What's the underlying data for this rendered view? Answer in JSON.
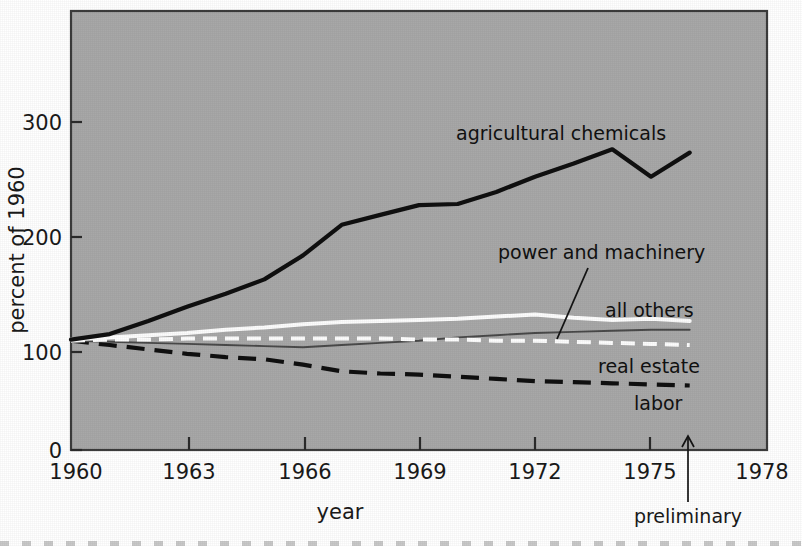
{
  "chart_data": {
    "type": "line",
    "title": "",
    "subtitle": "",
    "xlabel": "year",
    "ylabel": "percent of 1960",
    "xlim": [
      1960,
      1978
    ],
    "ylim": [
      0,
      330
    ],
    "grid": false,
    "legend_position": "inline-labels",
    "background_color": "#a8a8a8",
    "x_ticks": [
      "1960",
      "1963",
      "1966",
      "1969",
      "1972",
      "1975",
      "1978"
    ],
    "x_tick_values": [
      1960,
      1963,
      1966,
      1969,
      1972,
      1975,
      1978
    ],
    "y_ticks": [
      "0",
      "100",
      "200",
      "300"
    ],
    "y_tick_values": [
      0,
      100,
      200,
      300
    ],
    "x": [
      1960,
      1961,
      1962,
      1963,
      1964,
      1965,
      1966,
      1967,
      1968,
      1969,
      1970,
      1971,
      1972,
      1973,
      1974,
      1975,
      1976
    ],
    "annotations": [
      {
        "text": "preliminary",
        "points_to_year": 1976
      }
    ],
    "series": [
      {
        "name": "agricultural chemicals",
        "label": "agricultural chemicals",
        "style": "solid",
        "color": "#101010",
        "width": "thick",
        "values": [
          101,
          106,
          118,
          131,
          143,
          156,
          178,
          206,
          215,
          224,
          225,
          236,
          250,
          262,
          275,
          250,
          272
        ]
      },
      {
        "name": "power and machinery",
        "label": "power and machinery",
        "style": "solid",
        "color": "#fdfdfd",
        "width": "thick",
        "values": [
          101,
          103,
          105,
          107,
          110,
          112,
          115,
          117,
          118,
          119,
          120,
          122,
          124,
          121,
          119,
          120,
          118
        ]
      },
      {
        "name": "all others",
        "label": "all others",
        "style": "solid",
        "color": "#4a4a4a",
        "width": "thin",
        "values": [
          100,
          99,
          98,
          97,
          96,
          95,
          94,
          96,
          98,
          100,
          103,
          105,
          107,
          108,
          109,
          110,
          110
        ]
      },
      {
        "name": "real estate",
        "label": "real estate",
        "style": "dashed",
        "color": "#fdfdfd",
        "width": "thick",
        "values": [
          100,
          101,
          101,
          102,
          102,
          102,
          102,
          102,
          102,
          101,
          101,
          100,
          100,
          99,
          98,
          97,
          96
        ]
      },
      {
        "name": "labor",
        "label": "labor",
        "style": "dashed",
        "color": "#101010",
        "width": "thick",
        "values": [
          100,
          96,
          92,
          88,
          85,
          83,
          78,
          72,
          70,
          69,
          67,
          65,
          63,
          62,
          61,
          60,
          59
        ]
      }
    ]
  },
  "axes": {
    "y_title": "percent of 1960",
    "x_title": "year"
  },
  "labels": {
    "agricultural_chemicals": "agricultural chemicals",
    "power_and_machinery": "power and machinery",
    "all_others": "all others",
    "real_estate": "real estate",
    "labor": "labor",
    "preliminary": "preliminary"
  },
  "x_tick_labels": {
    "t0": "1960",
    "t1": "1963",
    "t2": "1966",
    "t3": "1969",
    "t4": "1972",
    "t5": "1975",
    "t6": "1978"
  },
  "y_tick_labels": {
    "t0": "0",
    "t1": "100",
    "t2": "200",
    "t3": "300"
  }
}
